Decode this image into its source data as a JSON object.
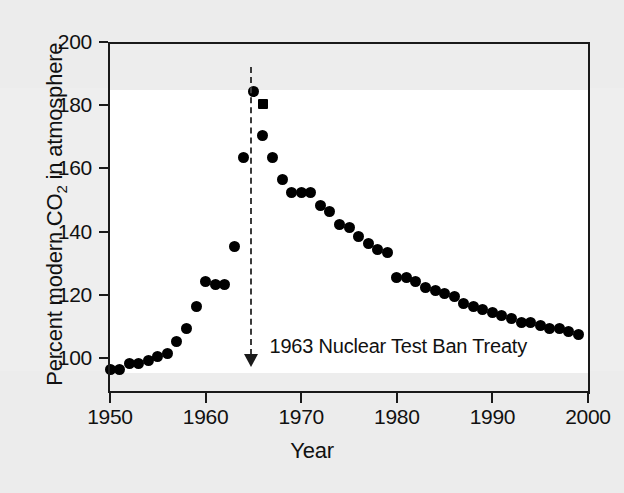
{
  "chart_data": {
    "type": "scatter",
    "title": "",
    "xlabel": "Year",
    "ylabel_parts": {
      "before": "Percent modern CO",
      "sub": "2",
      "after": " in atmosphere"
    },
    "ylabel": "Percent modern CO2 in atmosphere",
    "xlim": [
      1949,
      2000
    ],
    "ylim": [
      96,
      200
    ],
    "xticks": [
      1950,
      1960,
      1970,
      1980,
      1990,
      2000
    ],
    "xtick_labels": [
      "1950",
      "1960",
      "1970",
      "1980",
      "1990",
      "2000"
    ],
    "yticks": [
      100,
      120,
      140,
      160,
      180,
      200
    ],
    "ytick_labels": [
      "100",
      "120",
      "140",
      "160",
      "180",
      "200"
    ],
    "grid": false,
    "legend": null,
    "marker_color": "#000000",
    "series": [
      {
        "name": "Atmospheric radiocarbon (percent modern CO2)",
        "marker": "circle",
        "x": [
          1950,
          1951,
          1952,
          1953,
          1954,
          1955,
          1956,
          1957,
          1958,
          1959,
          1960,
          1961,
          1962,
          1963,
          1964,
          1965,
          1966,
          1967,
          1968,
          1969,
          1970,
          1971,
          1972,
          1973,
          1974,
          1975,
          1976,
          1977,
          1978,
          1979,
          1980,
          1981,
          1982,
          1983,
          1984,
          1985,
          1986,
          1987,
          1988,
          1989,
          1990,
          1991,
          1992,
          1993,
          1994,
          1995,
          1996,
          1997,
          1998,
          1999
        ],
        "y": [
          97,
          97,
          99,
          99,
          100,
          101,
          102,
          106,
          110,
          117,
          125,
          124,
          124,
          136,
          164,
          185,
          171,
          164,
          157,
          153,
          153,
          153,
          149,
          147,
          143,
          142,
          139,
          137,
          135,
          134,
          126,
          126,
          125,
          123,
          122,
          121,
          120,
          118,
          117,
          116,
          115,
          114,
          113,
          112,
          112,
          111,
          110,
          110,
          109,
          108
        ]
      },
      {
        "name": "Peak observation",
        "marker": "square",
        "x": [
          1966
        ],
        "y": [
          181
        ]
      }
    ],
    "annotations": [
      {
        "text": "1963 Nuclear Test Ban Treaty",
        "arrow_x": 1964.8,
        "arrow_from_y": 192,
        "arrow_to_y": 98,
        "line_style": "dashed",
        "arrowhead": "down"
      }
    ]
  }
}
